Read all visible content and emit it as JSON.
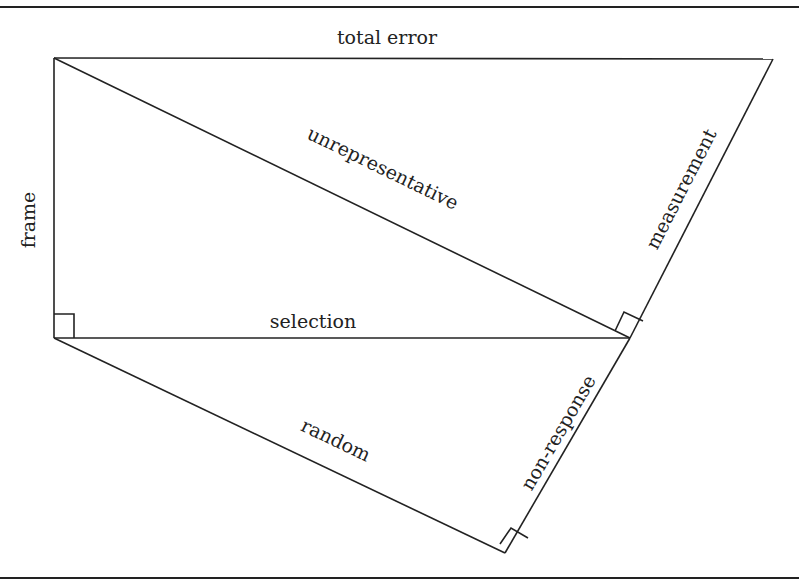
{
  "diagram": {
    "type": "error-decomposition-triangles",
    "colors": {
      "stroke": "#222222",
      "background": "#ffffff"
    },
    "labels": {
      "total_error": "total error",
      "frame": "frame",
      "unrepresentative": "unrepresentative",
      "measurement": "measurement",
      "selection": "selection",
      "random": "random",
      "non_response": "non-response"
    },
    "edges": [
      {
        "name": "total error",
        "from": "A",
        "to": "B"
      },
      {
        "name": "frame",
        "from": "A",
        "to": "D"
      },
      {
        "name": "unrepresentative",
        "from": "A",
        "to": "C"
      },
      {
        "name": "measurement",
        "from": "C",
        "to": "B"
      },
      {
        "name": "selection",
        "from": "D",
        "to": "C"
      },
      {
        "name": "random",
        "from": "D",
        "to": "E"
      },
      {
        "name": "non-response",
        "from": "E",
        "to": "C"
      }
    ],
    "right_angles": [
      "D",
      "C",
      "E"
    ]
  }
}
